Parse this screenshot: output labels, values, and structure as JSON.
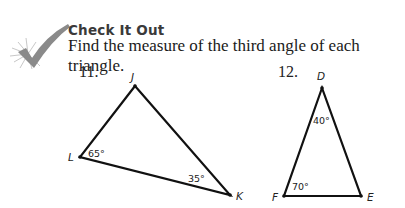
{
  "section": {
    "icon": "checkmark-burst-icon",
    "title": "Check It Out",
    "instruction": "Find the measure of the third angle of each triangle."
  },
  "problems": [
    {
      "number": "11.",
      "triangle": {
        "vertices": [
          {
            "label": "J",
            "angle": ""
          },
          {
            "label": "L",
            "angle": "65°"
          },
          {
            "label": "K",
            "angle": "35°"
          }
        ]
      }
    },
    {
      "number": "12.",
      "triangle": {
        "vertices": [
          {
            "label": "D",
            "angle": "40°"
          },
          {
            "label": "F",
            "angle": "70°"
          },
          {
            "label": "E",
            "angle": ""
          }
        ]
      }
    }
  ]
}
